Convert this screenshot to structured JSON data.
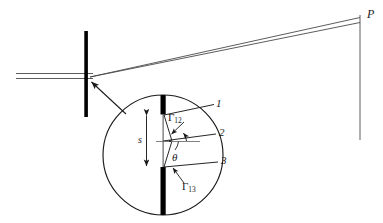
{
  "figure": {
    "type": "optics-diffraction-diagram",
    "ink_color": "#1a1a1a",
    "barrier_color": "#000000",
    "background": "#ffffff",
    "width": 383,
    "height": 223
  },
  "labels": {
    "point_p": "P",
    "ray_1": "1",
    "ray_2": "2",
    "ray_3": "3",
    "slit_separation": "s",
    "angle_theta": "θ",
    "gamma_12_base": "Γ",
    "gamma_12_sub": "12",
    "gamma_13_base": "Γ",
    "gamma_13_sub": "13"
  },
  "elements": {
    "incoming_beam": "two parallel horizontal rays entering from left",
    "barrier": "vertical opaque screen with slit",
    "magnifier_circle": "circular callout showing enlarged slit detail",
    "callout_arrow": "arrow from magnified circle to slit on barrier",
    "observation_screen": "vertical line at right where rays converge at P",
    "diffracted_beam": "two rays diverging from slit to point P"
  }
}
